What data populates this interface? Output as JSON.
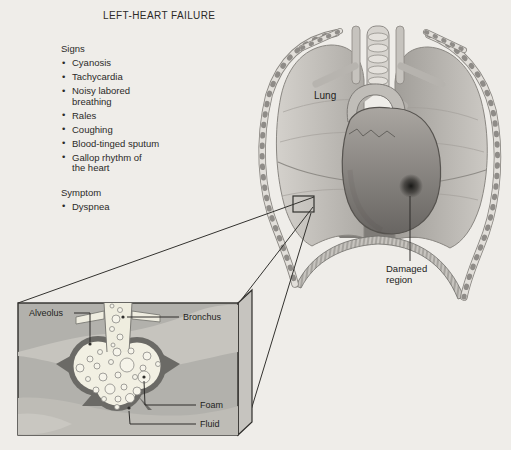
{
  "title": "LEFT-HEART FAILURE",
  "signs": {
    "heading": "Signs",
    "items": [
      "Cyanosis",
      "Tachycardia",
      "Noisy labored\nbreathing",
      "Rales",
      "Coughing",
      "Blood-tinged sputum",
      "Gallop rhythm of\nthe heart"
    ]
  },
  "symptom": {
    "heading": "Symptom",
    "items": [
      "Dyspnea"
    ]
  },
  "labels": {
    "lung": "Lung",
    "damaged_region": "Damaged region",
    "alveolus": "Alveolus",
    "bronchus": "Bronchus",
    "foam": "Foam",
    "fluid": "Fluid"
  },
  "colors": {
    "background": "#efede9",
    "ink": "#2b2a28",
    "illustration_gray": "#b3b2ad",
    "alveolus_wall": "#6b6a66",
    "alveolus_interior": "#f2f0e3"
  }
}
